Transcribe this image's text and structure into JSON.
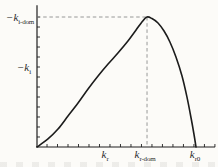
{
  "figure": {
    "background": "#fcfbf8",
    "axis_color": "#1f1f1f",
    "curve_color": "#1c1c1c",
    "dash_color": "#8c8c8c",
    "label_color": "#2a2a2a"
  },
  "labels": {
    "y_ki_dom": {
      "main": "−k",
      "sub": "i-dom"
    },
    "y_ki": {
      "main": "−k",
      "sub": "i"
    },
    "x_kr": {
      "main": "k",
      "sub": "r"
    },
    "x_kr_dom": {
      "main": "k",
      "sub": "r-dom"
    },
    "x_kr0": {
      "main": "k",
      "sub": "r0"
    }
  },
  "chart_data": {
    "type": "line",
    "title": "",
    "xlabel": "",
    "ylabel": "",
    "xlim": [
      0,
      1.12
    ],
    "ylim": [
      0,
      1.09
    ],
    "x_units": "k_r in units of k_r0",
    "y_units": "−k_i in units of −k_i-dom",
    "grid": false,
    "legend": false,
    "x_tick_labels": [
      {
        "label": "k_r",
        "x": 0.428
      },
      {
        "label": "k_r-dom",
        "x": 0.692
      },
      {
        "label": "k_r0",
        "x": 1.0
      }
    ],
    "y_tick_labels": [
      {
        "label": "−k_i-dom",
        "y": 1.0
      },
      {
        "label": "−k_i",
        "y": 0.61
      }
    ],
    "series": [
      {
        "name": "spatial growth rate curve",
        "points": [
          [
            0.0,
            0.0
          ],
          [
            0.069,
            0.062
          ],
          [
            0.132,
            0.138
          ],
          [
            0.195,
            0.238
          ],
          [
            0.258,
            0.338
          ],
          [
            0.321,
            0.446
          ],
          [
            0.384,
            0.546
          ],
          [
            0.447,
            0.638
          ],
          [
            0.509,
            0.723
          ],
          [
            0.572,
            0.815
          ],
          [
            0.623,
            0.9
          ],
          [
            0.66,
            0.962
          ],
          [
            0.692,
            1.0
          ],
          [
            0.723,
            0.988
          ],
          [
            0.761,
            0.954
          ],
          [
            0.799,
            0.892
          ],
          [
            0.836,
            0.808
          ],
          [
            0.874,
            0.692
          ],
          [
            0.912,
            0.546
          ],
          [
            0.943,
            0.385
          ],
          [
            0.969,
            0.223
          ],
          [
            0.987,
            0.1
          ],
          [
            1.0,
            0.0
          ]
        ]
      }
    ],
    "guides": {
      "peak": {
        "x": 0.692,
        "y": 1.0
      },
      "dashed_horizontal": {
        "y": 1.0,
        "from_x": 0,
        "to_x": 0.692
      },
      "dashed_vertical": {
        "x": 0.692,
        "from_y": 0,
        "to_y": 1.0
      }
    },
    "layout": {
      "origin_px": [
        37,
        147
      ],
      "scale_px": [
        159,
        130
      ],
      "x_ticks": {
        "start": 0.063,
        "step": 0.066,
        "count": 17,
        "len_px": 3
      },
      "y_ticks": {
        "start": 0.077,
        "step": 0.0769,
        "count": 13,
        "len_px": 3
      }
    }
  }
}
